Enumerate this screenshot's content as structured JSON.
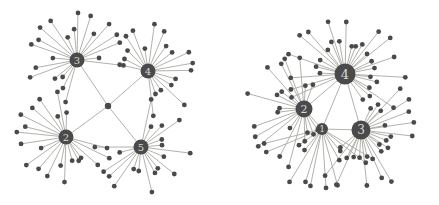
{
  "figure": {
    "width": 439,
    "height": 205,
    "background": "#ffffff",
    "node_color": "#4a4a4a",
    "edge_color": "#a7a9a3",
    "hub_label_color": "#d9d9d9",
    "leaf_node_r": 2.4,
    "edge_width": 0.9
  },
  "graphs": [
    {
      "name": "left-star-network",
      "type": "hub-and-spoke",
      "center": {
        "x": 108,
        "y": 106,
        "r": 3.2
      },
      "hubs": [
        {
          "label": "3",
          "x": 77,
          "y": 60,
          "r": 7.5,
          "label_size": 10,
          "leaf_count": 21,
          "fan_center_deg": 125,
          "fan_spread_deg": 262,
          "leaf_r_inner": 27,
          "leaf_r_outer": 46
        },
        {
          "label": "4",
          "x": 148,
          "y": 71,
          "r": 7.5,
          "label_size": 10,
          "leaf_count": 19,
          "fan_center_deg": 40,
          "fan_spread_deg": 252,
          "leaf_r_inner": 26,
          "leaf_r_outer": 45
        },
        {
          "label": "2",
          "x": 66,
          "y": 137,
          "r": 7.5,
          "label_size": 10,
          "leaf_count": 21,
          "fan_center_deg": 217,
          "fan_spread_deg": 262,
          "leaf_r_inner": 27,
          "leaf_r_outer": 46
        },
        {
          "label": "5",
          "x": 141,
          "y": 147,
          "r": 7.5,
          "label_size": 10,
          "leaf_count": 19,
          "fan_center_deg": 310,
          "fan_spread_deg": 255,
          "leaf_r_inner": 26,
          "leaf_r_outer": 45
        }
      ],
      "edges": [
        [
          "center",
          "3"
        ],
        [
          "center",
          "4"
        ],
        [
          "center",
          "2"
        ],
        [
          "center",
          "5"
        ]
      ]
    },
    {
      "name": "right-star-network",
      "type": "hub-and-spoke",
      "center": null,
      "hubs": [
        {
          "label": "4",
          "x": 345,
          "y": 74,
          "r": 10.5,
          "label_size": 13,
          "leaf_count": 30,
          "fan_center_deg": 75,
          "fan_spread_deg": 255,
          "leaf_r_inner": 30,
          "leaf_r_outer": 56
        },
        {
          "label": "2",
          "x": 304,
          "y": 109,
          "r": 8.5,
          "label_size": 11,
          "leaf_count": 21,
          "fan_center_deg": 188,
          "fan_spread_deg": 230,
          "leaf_r_inner": 28,
          "leaf_r_outer": 55
        },
        {
          "label": "1",
          "x": 322,
          "y": 129,
          "r": 6,
          "label_size": 9,
          "leaf_count": 13,
          "fan_center_deg": 262,
          "fan_spread_deg": 140,
          "leaf_r_inner": 32,
          "leaf_r_outer": 58
        },
        {
          "label": "3",
          "x": 361,
          "y": 130,
          "r": 9.5,
          "label_size": 12,
          "leaf_count": 24,
          "fan_center_deg": 325,
          "fan_spread_deg": 205,
          "leaf_r_inner": 28,
          "leaf_r_outer": 56
        }
      ],
      "edges": [
        [
          "4",
          "2"
        ],
        [
          "4",
          "1"
        ],
        [
          "4",
          "3"
        ],
        [
          "2",
          "1"
        ],
        [
          "1",
          "3"
        ]
      ]
    }
  ]
}
